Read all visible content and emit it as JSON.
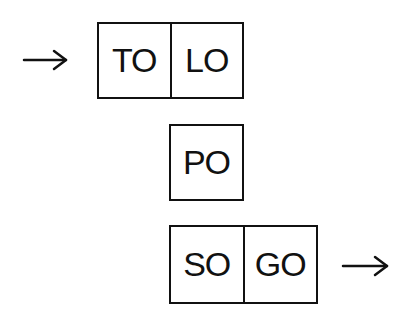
{
  "diagram": {
    "rows": [
      {
        "id": "row-1",
        "incoming_arrow": true,
        "outgoing_arrow": false,
        "cells": [
          {
            "label": "TO"
          },
          {
            "label": "LO"
          }
        ]
      },
      {
        "id": "row-2",
        "incoming_arrow": false,
        "outgoing_arrow": false,
        "cells": [
          {
            "label": "PO"
          }
        ]
      },
      {
        "id": "row-3",
        "incoming_arrow": false,
        "outgoing_arrow": true,
        "cells": [
          {
            "label": "SO"
          },
          {
            "label": "GO"
          }
        ]
      }
    ],
    "colors": {
      "stroke": "#111111",
      "background": "#ffffff"
    }
  }
}
